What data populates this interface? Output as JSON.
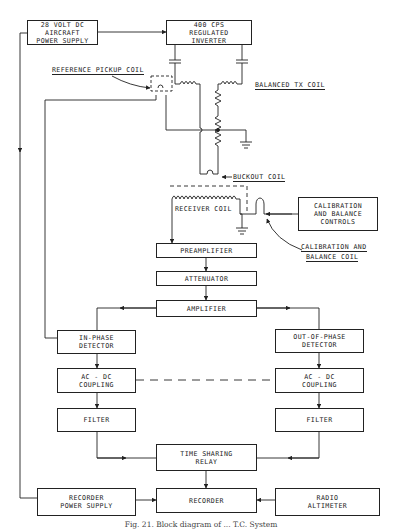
{
  "diagram": {
    "type": "block diagram",
    "caption": "Fig. 21. Block diagram of ... T.C. System",
    "blocks": {
      "aircraft_power": [
        "28 VOLT DC",
        "AIRCRAFT",
        "POWER SUPPLY"
      ],
      "inverter": [
        "400 CPS",
        "REGULATED",
        "INVERTER"
      ],
      "cal_controls": [
        "CALIBRATION",
        "AND BALANCE",
        "CONTROLS"
      ],
      "preamplifier": [
        "PREAMPLIFIER"
      ],
      "attenuator": [
        "ATTENUATOR"
      ],
      "amplifier": [
        "AMPLIFIER"
      ],
      "in_phase_detector": [
        "IN-PHASE",
        "DETECTOR"
      ],
      "out_phase_detector": [
        "OUT-OF-PHASE",
        "DETECTOR"
      ],
      "acdc_left": [
        "AC - DC",
        "COUPLING"
      ],
      "acdc_right": [
        "AC - DC",
        "COUPLING"
      ],
      "filter_left": [
        "FILTER"
      ],
      "filter_right": [
        "FILTER"
      ],
      "time_sharing_relay": [
        "TIME SHARING",
        "RELAY"
      ],
      "recorder_power": [
        "RECORDER",
        "POWER SUPPLY"
      ],
      "recorder": [
        "RECORDER"
      ],
      "radio_altimeter": [
        "RADIO",
        "ALTIMETER"
      ]
    },
    "labels": {
      "reference_pickup_coil": "REFERENCE PICKUP COIL",
      "balanced_tx_coil": "BALANCED TX COIL",
      "buckout_coil": "BUCKOUT COIL",
      "receiver_coil": "RECEIVER COIL",
      "cal_coil_line1": "CALIBRATION AND",
      "cal_coil_line2": "BALANCE COIL"
    }
  }
}
